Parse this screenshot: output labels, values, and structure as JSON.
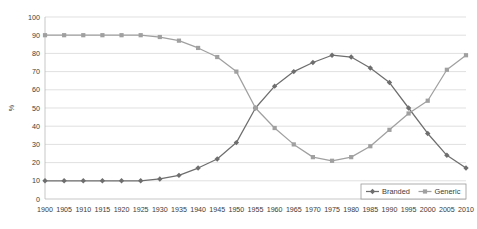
{
  "chart_data": {
    "type": "line",
    "title": "",
    "subtitle": "",
    "xlabel": "",
    "ylabel": "%",
    "ylim": [
      0,
      100
    ],
    "ytick_step": 10,
    "grid": true,
    "legend_position": "bottom-right",
    "x": [
      1900,
      1905,
      1910,
      1915,
      1920,
      1925,
      1930,
      1935,
      1940,
      1945,
      1950,
      1955,
      1960,
      1965,
      1970,
      1975,
      1980,
      1985,
      1990,
      1995,
      2000,
      2005,
      2010
    ],
    "categories": [
      "1900",
      "1905",
      "1910",
      "1915",
      "1920",
      "1925",
      "1930",
      "1935",
      "1940",
      "1945",
      "1950",
      "1955",
      "1960",
      "1965",
      "1970",
      "1975",
      "1980",
      "1985",
      "1990",
      "1995",
      "2000",
      "2005",
      "2010"
    ],
    "yticks": [
      "0",
      "10",
      "20",
      "30",
      "40",
      "50",
      "60",
      "70",
      "80",
      "90",
      "100"
    ],
    "series": [
      {
        "name": "Branded",
        "color": "#6e6e6e",
        "marker": "diamond",
        "values": [
          10,
          10,
          10,
          10,
          10,
          10,
          11,
          13,
          17,
          22,
          31,
          50,
          62,
          70,
          75,
          79,
          78,
          72,
          64,
          50,
          36,
          24,
          17
        ]
      },
      {
        "name": "Generic",
        "color": "#a0a0a0",
        "marker": "square",
        "values": [
          90,
          90,
          90,
          90,
          90,
          90,
          89,
          87,
          83,
          78,
          70,
          50,
          39,
          30,
          23,
          21,
          23,
          29,
          38,
          47,
          54,
          71,
          79
        ]
      }
    ]
  },
  "legend": {
    "items": [
      {
        "label": "Branded"
      },
      {
        "label": "Generic"
      }
    ]
  },
  "axes": {
    "y_title": "%"
  }
}
